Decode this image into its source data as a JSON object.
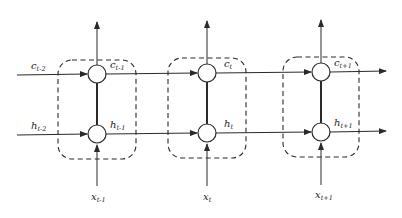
{
  "diagram": {
    "type": "unrolled-recurrent-network",
    "colors": {
      "stroke": "#2a2a2a",
      "dash": "#2a2a2a",
      "background": "#ffffff"
    },
    "incoming": {
      "c": {
        "base": "c",
        "sub": "t-2"
      },
      "h": {
        "base": "h",
        "sub": "t-2"
      }
    },
    "cells": [
      {
        "id": "cell-t-minus-1",
        "c_out": {
          "base": "c",
          "sub": "t-1"
        },
        "h_out": {
          "base": "h",
          "sub": "t-1"
        },
        "input": {
          "base": "x",
          "sub": "t-1"
        }
      },
      {
        "id": "cell-t",
        "c_out": {
          "base": "c",
          "sub": "t"
        },
        "h_out": {
          "base": "h",
          "sub": "t"
        },
        "input": {
          "base": "x",
          "sub": "t"
        }
      },
      {
        "id": "cell-t-plus-1",
        "c_out": {
          "base": "c",
          "sub": "t+1"
        },
        "h_out": {
          "base": "h",
          "sub": "t+1"
        },
        "input": {
          "base": "x",
          "sub": "t+1"
        }
      }
    ]
  }
}
